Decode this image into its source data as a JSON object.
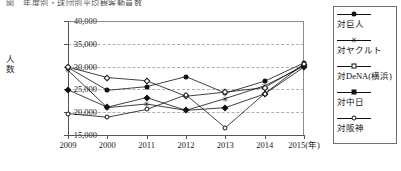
{
  "chart_title": "図　年度別・球団別平均観客動員数",
  "axis": {
    "y_title": "人数",
    "x_unit_label": "2015(年)",
    "y_ticks": [
      "40,000",
      "35,000",
      "30,000",
      "25,000",
      "20,000",
      "15,000"
    ],
    "x_ticks": [
      "2009",
      "2000",
      "2011",
      "2012",
      "2013",
      "2014",
      "2015(年)"
    ]
  },
  "legend": {
    "items": [
      {
        "label": "対巨人",
        "marker": "filled-circle"
      },
      {
        "label": "対ヤクルト",
        "marker": "star"
      },
      {
        "label": "対DeNA(横浜)",
        "marker": "open-diamond"
      },
      {
        "label": "対中日",
        "marker": "filled-diamond"
      },
      {
        "label": "対阪神",
        "marker": "open-circle"
      }
    ]
  },
  "chart_data": {
    "type": "line",
    "title": "図　年度別・球団別平均観客動員数",
    "xlabel": "年",
    "ylabel": "人数",
    "categories": [
      "2009",
      "2000",
      "2011",
      "2012",
      "2013",
      "2014",
      "2015"
    ],
    "ylim": [
      15000,
      40000
    ],
    "ytick_step": 5000,
    "grid": true,
    "legend_position": "right",
    "series": [
      {
        "name": "対巨人",
        "marker": "filled-circle",
        "values": [
          29800,
          24800,
          25600,
          27800,
          24200,
          26800,
          30800
        ]
      },
      {
        "name": "対ヤクルト",
        "marker": "star",
        "values": [
          29200,
          21000,
          21800,
          20400,
          23000,
          25800,
          30100
        ]
      },
      {
        "name": "対DeNA(横浜)",
        "marker": "open-diamond",
        "values": [
          29900,
          27600,
          26900,
          23500,
          24400,
          25400,
          30400
        ]
      },
      {
        "name": "対中日",
        "marker": "filled-diamond",
        "values": [
          24900,
          21100,
          23200,
          20400,
          21000,
          24000,
          29900
        ]
      },
      {
        "name": "対阪神",
        "marker": "open-circle",
        "values": [
          19700,
          18900,
          20600,
          23800,
          16600,
          24100,
          30600
        ]
      }
    ]
  }
}
